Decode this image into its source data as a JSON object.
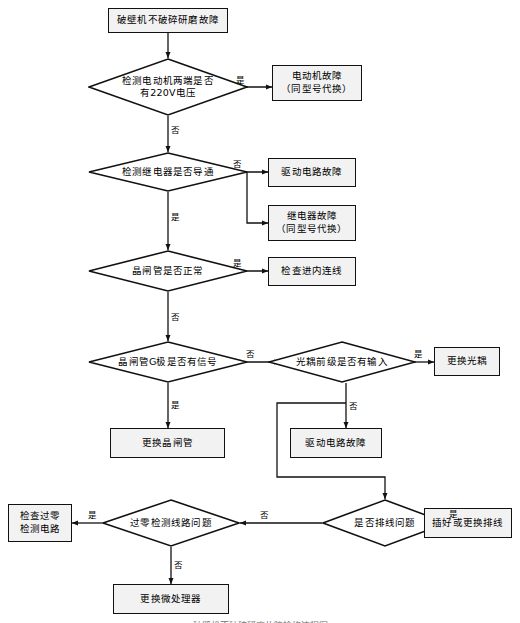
{
  "figure": {
    "type": "flowchart",
    "title": "破壁机不破碎研磨故障检修流程图",
    "orientation": "top-to-bottom",
    "language": "zh-CN",
    "colors": {
      "stroke": "#111111",
      "box_fill": "#f2f2f2",
      "background": "#ffffff",
      "text": "#000000"
    }
  },
  "nodes": {
    "start": {
      "shape": "rect",
      "label": "破壁机不破碎研磨故障"
    },
    "d_motor_voltage": {
      "shape": "diamond",
      "label_line1": "检测电动机两端是否",
      "label_line2": "有220V电压"
    },
    "motor_fault": {
      "shape": "rect",
      "label_line1": "电动机故障",
      "label_line2": "（同型号代换）"
    },
    "d_relay": {
      "shape": "diamond",
      "label": "检测继电器是否导通"
    },
    "drive_fault_1": {
      "shape": "rect",
      "label": "驱动电路故障"
    },
    "relay_fault": {
      "shape": "rect",
      "label_line1": "继电器故障",
      "label_line2": "（同型号代换）"
    },
    "d_scr_normal": {
      "shape": "diamond",
      "label": "晶闸管是否正常"
    },
    "check_inner_wire": {
      "shape": "rect",
      "label": "检查进内连线"
    },
    "d_scr_gate": {
      "shape": "diamond",
      "label": "晶闸管G极是否有信号"
    },
    "d_opto_input": {
      "shape": "diamond",
      "label": "光耦前级是否有输入"
    },
    "replace_opto": {
      "shape": "rect",
      "label": "更换光耦"
    },
    "replace_scr": {
      "shape": "rect",
      "label": "更换晶闸管"
    },
    "drive_fault_2": {
      "shape": "rect",
      "label": "驱动电路故障"
    },
    "d_zero_cross": {
      "shape": "diamond",
      "label": "过零检测线路问题"
    },
    "d_ribbon_cable": {
      "shape": "diamond",
      "label": "是否排线问题"
    },
    "check_zero_circuit": {
      "shape": "rect",
      "label_line1": "检查过零",
      "label_line2": "检测电路"
    },
    "replace_cable": {
      "shape": "rect",
      "label": "插好或更换排线"
    },
    "replace_mcu": {
      "shape": "rect",
      "label": "更换微处理器"
    }
  },
  "edge_labels": {
    "motor_yes": "是",
    "motor_no": "否",
    "relay_no": "否",
    "relay_yes": "是",
    "scr_yes": "是",
    "scr_no": "否",
    "gate_no": "否",
    "gate_yes": "是",
    "opto_yes": "是",
    "opto_no": "否",
    "ribbon_yes": "是",
    "ribbon_no": "否",
    "zero_yes": "是",
    "zero_no": "否"
  },
  "edges": [
    {
      "from": "start",
      "to": "d_motor_voltage",
      "label": ""
    },
    {
      "from": "d_motor_voltage",
      "to": "motor_fault",
      "label": "是"
    },
    {
      "from": "d_motor_voltage",
      "to": "d_relay",
      "label": "否"
    },
    {
      "from": "d_relay",
      "to": "drive_fault_1",
      "label": "否"
    },
    {
      "from": "d_relay",
      "to": "relay_fault",
      "label": "否"
    },
    {
      "from": "d_relay",
      "to": "d_scr_normal",
      "label": "是"
    },
    {
      "from": "d_scr_normal",
      "to": "check_inner_wire",
      "label": "是"
    },
    {
      "from": "d_scr_normal",
      "to": "d_scr_gate",
      "label": "否"
    },
    {
      "from": "d_scr_gate",
      "to": "d_opto_input",
      "label": "否"
    },
    {
      "from": "d_scr_gate",
      "to": "replace_scr",
      "label": "是"
    },
    {
      "from": "d_opto_input",
      "to": "replace_opto",
      "label": "是"
    },
    {
      "from": "d_opto_input",
      "to": "drive_fault_2",
      "label": "否"
    },
    {
      "from": "d_opto_input",
      "to": "d_ribbon_cable",
      "label": "否"
    },
    {
      "from": "d_ribbon_cable",
      "to": "replace_cable",
      "label": "是"
    },
    {
      "from": "d_ribbon_cable",
      "to": "d_zero_cross",
      "label": "否"
    },
    {
      "from": "d_zero_cross",
      "to": "check_zero_circuit",
      "label": "是"
    },
    {
      "from": "d_zero_cross",
      "to": "replace_mcu",
      "label": "否"
    }
  ]
}
